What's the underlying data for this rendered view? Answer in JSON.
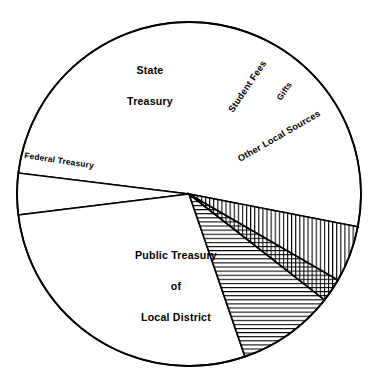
{
  "chart_data": {
    "type": "pie",
    "title": "",
    "subtitle": "",
    "xlabel": "",
    "ylabel": "",
    "legend_position": "none",
    "grid": false,
    "units": "percent of total revenue",
    "categories": [
      "Public Treasury of Local District",
      "Federal Treasury",
      "State Treasury",
      "Student Fees",
      "Gifts",
      "Other Local Sources"
    ],
    "values": [
      51.1,
      3.9,
      28.3,
      9.2,
      2.2,
      5.3
    ],
    "slices": [
      {
        "label": "Public Treasury of Local District",
        "label_lines": [
          "Public Treasury",
          "of",
          "Local District"
        ],
        "value": 51.1,
        "start_angle_deg": 349,
        "end_angle_deg": 173,
        "sweep_deg": 184,
        "fill": "#ffffff",
        "pattern": "none",
        "label_orientation": "horizontal"
      },
      {
        "label": "Federal Treasury",
        "label_lines": [
          "Federal Treasury"
        ],
        "value": 3.9,
        "start_angle_deg": 173,
        "end_angle_deg": 187,
        "sweep_deg": 14,
        "fill": "#ffffff",
        "pattern": "none",
        "label_orientation": "rotated"
      },
      {
        "label": "State Treasury",
        "label_lines": [
          "State",
          "Treasury"
        ],
        "value": 28.3,
        "start_angle_deg": 187,
        "end_angle_deg": 289,
        "sweep_deg": 102,
        "fill": "#ffffff",
        "pattern": "none",
        "label_orientation": "horizontal"
      },
      {
        "label": "Student Fees",
        "label_lines": [
          "Student Fees"
        ],
        "value": 9.2,
        "start_angle_deg": 289,
        "end_angle_deg": 322,
        "sweep_deg": 33,
        "fill": "#ffffff",
        "pattern": "horizontal-hatch",
        "label_orientation": "rotated"
      },
      {
        "label": "Gifts",
        "label_lines": [
          "Gifts"
        ],
        "value": 2.2,
        "start_angle_deg": 322,
        "end_angle_deg": 330,
        "sweep_deg": 8,
        "fill": "#ffffff",
        "pattern": "cross-hatch",
        "label_orientation": "rotated"
      },
      {
        "label": "Other Local Sources",
        "label_lines": [
          "Other Local Sources"
        ],
        "value": 5.3,
        "start_angle_deg": 330,
        "end_angle_deg": 349,
        "sweep_deg": 19,
        "fill": "#ffffff",
        "pattern": "vertical-hatch",
        "label_orientation": "rotated"
      }
    ]
  },
  "labels": {
    "public_treasury_line1": "Public Treasury",
    "public_treasury_line2": "of",
    "public_treasury_line3": "Local District",
    "state_treasury_line1": "State",
    "state_treasury_line2": "Treasury",
    "federal_treasury": "Federal Treasury",
    "student_fees": "Student Fees",
    "gifts": "Gifts",
    "other_local_sources": "Other Local Sources"
  },
  "colors": {
    "background": "#ffffff",
    "stroke": "#000000",
    "fill": "#ffffff",
    "text": "#000000"
  },
  "geometry": {
    "center_x": 189,
    "center_y": 194,
    "radius": 172
  }
}
